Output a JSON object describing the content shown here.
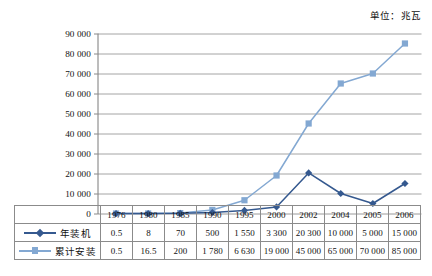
{
  "unit_caption": "单位：兆瓦",
  "colors": {
    "series_annual": "#35598f",
    "series_cumulative": "#83a8d2",
    "gridline": "#9a9a9a",
    "axis": "#7a7a7a",
    "table_border": "#8b8b8b",
    "text": "#111111"
  },
  "chart_data": {
    "type": "line",
    "title": "",
    "subtitle": "",
    "xlabel": "",
    "ylabel": "",
    "annotations": [
      "单位：兆瓦"
    ],
    "grid": true,
    "legend_position": "table-row-labels",
    "ylim": [
      0,
      90000
    ],
    "yticks": [
      0,
      10000,
      20000,
      30000,
      40000,
      50000,
      60000,
      70000,
      80000,
      90000
    ],
    "ytick_labels": [
      "0",
      "10 000",
      "20 000",
      "30 000",
      "40 000",
      "50 000",
      "60 000",
      "70 000",
      "80 000",
      "90 000"
    ],
    "categories": [
      "1976",
      "1980",
      "1985",
      "1990",
      "1995",
      "2000",
      "2002",
      "2004",
      "2005",
      "2006"
    ],
    "series": [
      {
        "name": "年装机",
        "marker": "diamond",
        "color": "#35598f",
        "values": [
          0.5,
          8,
          70,
          500,
          1550,
          3300,
          20300,
          10000,
          5000,
          15000
        ],
        "labels": [
          "0.5",
          "8",
          "70",
          "500",
          "1 550",
          "3 300",
          "20 300",
          "10 000",
          "5 000",
          "15 000"
        ]
      },
      {
        "name": "累计安装",
        "marker": "square",
        "color": "#83a8d2",
        "values": [
          0.5,
          16.5,
          200,
          1780,
          6630,
          19000,
          45000,
          65000,
          70000,
          85000
        ],
        "labels": [
          "0.5",
          "16.5",
          "200",
          "1 780",
          "6 630",
          "19 000",
          "45 000",
          "65 000",
          "70 000",
          "85 000"
        ]
      }
    ]
  },
  "table": {
    "corner_label": "",
    "header_row": [
      "1976",
      "1980",
      "1985",
      "1990",
      "1995",
      "2000",
      "2002",
      "2004",
      "2005",
      "2006"
    ],
    "rows": [
      {
        "label": "年装机",
        "marker": "diamond",
        "cells": [
          "0.5",
          "8",
          "70",
          "500",
          "1 550",
          "3 300",
          "20 300",
          "10 000",
          "5 000",
          "15 000"
        ]
      },
      {
        "label": "累计安装",
        "marker": "square",
        "cells": [
          "0.5",
          "16.5",
          "200",
          "1 780",
          "6 630",
          "19 000",
          "45 000",
          "65 000",
          "70 000",
          "85 000"
        ]
      }
    ]
  }
}
